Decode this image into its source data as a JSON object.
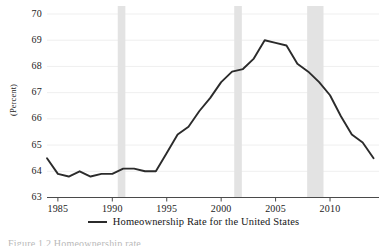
{
  "chart_data": {
    "type": "line",
    "title": "",
    "xlabel": "",
    "ylabel": "(Percent)",
    "xlim": [
      1984,
      2014.5
    ],
    "ylim": [
      63,
      70
    ],
    "xticks": [
      1985,
      1990,
      1995,
      2000,
      2005,
      2010
    ],
    "yticks": [
      63,
      64,
      65,
      66,
      67,
      68,
      69,
      70
    ],
    "grid": "horizontal-faint",
    "legend_position": "below-axes",
    "series": [
      {
        "name": "Homeownership Rate for the United States",
        "color": "#2b2b2b",
        "x": [
          1984,
          1985,
          1986,
          1987,
          1988,
          1989,
          1990,
          1991,
          1992,
          1993,
          1994,
          1995,
          1996,
          1997,
          1998,
          1999,
          2000,
          2001,
          2002,
          2003,
          2004,
          2005,
          2006,
          2007,
          2008,
          2009,
          2010,
          2011,
          2012,
          2013,
          2014
        ],
        "values": [
          64.5,
          63.9,
          63.8,
          64.0,
          63.8,
          63.9,
          63.9,
          64.1,
          64.1,
          64.0,
          64.0,
          64.7,
          65.4,
          65.7,
          66.3,
          66.8,
          67.4,
          67.8,
          67.9,
          68.3,
          69.0,
          68.9,
          68.8,
          68.1,
          67.8,
          67.4,
          66.9,
          66.1,
          65.4,
          65.1,
          64.5
        ]
      }
    ],
    "recession_bands": [
      {
        "label": "1990-91 recession",
        "start": 1990.5,
        "end": 1991.2
      },
      {
        "label": "2001 recession",
        "start": 2001.2,
        "end": 2001.9
      },
      {
        "label": "2007-09 recession",
        "start": 2007.9,
        "end": 2009.4
      }
    ],
    "band_color": "#e3e3e3",
    "axis_color": "#4a4a4a"
  },
  "legend": {
    "entry_label": "Homeownership Rate for the United States",
    "swatch_name": "line-swatch"
  },
  "axes": {
    "y_title": "(Percent)",
    "y_tick_labels": [
      "70",
      "69",
      "68",
      "67",
      "66",
      "65",
      "64",
      "63"
    ],
    "x_tick_labels": [
      "1985",
      "1990",
      "1995",
      "2000",
      "2005",
      "2010"
    ]
  },
  "footer": {
    "clipped_text": "Figure 1.2  Homeownership rate"
  }
}
